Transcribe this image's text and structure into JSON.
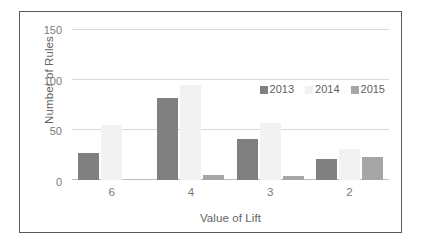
{
  "chart_data": {
    "type": "bar",
    "title": "",
    "xlabel": "Value of Lift",
    "ylabel": "Number of Rules",
    "categories": [
      "6",
      "4",
      "3",
      "2"
    ],
    "series": [
      {
        "name": "2013",
        "color": "#808080",
        "values": [
          27,
          82,
          41,
          21
        ]
      },
      {
        "name": "2014",
        "color": "#F2F2F2",
        "values": [
          55,
          95,
          57,
          31
        ]
      },
      {
        "name": "2015",
        "color": "#A6A6A6",
        "values": [
          0,
          5,
          4,
          23
        ]
      }
    ],
    "ylim": [
      0,
      150
    ],
    "yticks": [
      0,
      50,
      100,
      150
    ],
    "ytick_labels": [
      "0",
      "50",
      "100",
      "150"
    ],
    "grid": true,
    "grid_axis": "y",
    "legend_position": "upper-right-inside",
    "orientation": "vertical",
    "grouping": "grouped"
  },
  "axes": {
    "y_title": "Number of Rules",
    "x_title": "Value of Lift"
  },
  "colors": {
    "frame": "#5A5A5A",
    "gridline": "#D9D9D9",
    "axis_line": "#BDBDBD",
    "tick_text": "#7A7A7A",
    "title_text": "#636363",
    "series_2013": "#808080",
    "series_2014": "#F2F2F2",
    "series_2015": "#A6A6A6",
    "background": "#FFFFFF"
  }
}
